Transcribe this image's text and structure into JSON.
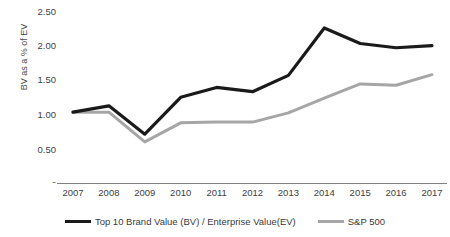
{
  "chart_data": {
    "type": "line",
    "title": "",
    "subtitle": "",
    "xlabel": "",
    "ylabel": "BV as a % of EV",
    "categories": [
      "2007",
      "2008",
      "2009",
      "2010",
      "2011",
      "2012",
      "2013",
      "2014",
      "2015",
      "2016",
      "2017"
    ],
    "x": [
      2007,
      2008,
      2009,
      2010,
      2011,
      2012,
      2013,
      2014,
      2015,
      2016,
      2017
    ],
    "ylim": [
      0,
      2.5
    ],
    "yticks": [
      0,
      0.5,
      1.0,
      1.5,
      2.0,
      2.5
    ],
    "ytick_labels": [
      "-",
      "0.50",
      "1.00",
      "1.50",
      "2.00",
      "2.50"
    ],
    "grid": false,
    "legend_position": "bottom",
    "series": [
      {
        "name": "Top 10 Brand Value (BV) / Enterprise Value(EV)",
        "color": "#1a1a1a",
        "values": [
          1.0,
          1.09,
          0.69,
          1.21,
          1.35,
          1.29,
          1.52,
          2.19,
          1.97,
          1.91,
          1.94
        ]
      },
      {
        "name": "S&P 500",
        "color": "#a6a6a6",
        "values": [
          1.0,
          1.0,
          0.58,
          0.85,
          0.86,
          0.86,
          0.99,
          1.2,
          1.4,
          1.38,
          1.53
        ]
      }
    ]
  },
  "axes": {
    "y_title": "BV as a % of EV",
    "y_tick_labels": [
      "2.50",
      "2.00",
      "1.50",
      "1.00",
      "0.50",
      "-"
    ],
    "x_tick_labels": [
      "2007",
      "2008",
      "2009",
      "2010",
      "2011",
      "2012",
      "2013",
      "2014",
      "2015",
      "2016",
      "2017"
    ]
  },
  "legend": {
    "items": [
      {
        "label": "Top 10 Brand Value (BV) / Enterprise Value(EV)",
        "color": "#1a1a1a"
      },
      {
        "label": "S&P 500",
        "color": "#a6a6a6"
      }
    ]
  },
  "colors": {
    "series_primary": "#1a1a1a",
    "series_secondary": "#a6a6a6",
    "axis": "#808080",
    "text": "#404040",
    "background": "#ffffff"
  }
}
